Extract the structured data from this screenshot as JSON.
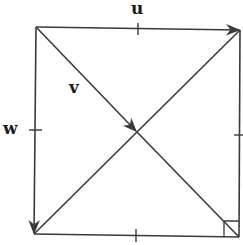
{
  "diagram": {
    "type": "vector-square",
    "labels": {
      "u": "u",
      "v": "v",
      "w": "w"
    },
    "colors": {
      "stroke": "#3a3a3a",
      "label": "#1a1a1a",
      "background": "#ffffff"
    },
    "vertices": {
      "top_left": [
        36,
        27
      ],
      "top_right": [
        240,
        30
      ],
      "bottom_left": [
        34,
        234
      ],
      "bottom_right": [
        239,
        237
      ],
      "center": [
        137,
        132
      ]
    },
    "vectors": [
      {
        "name": "u",
        "from": "top_left",
        "to": "top_right",
        "description": "top edge, arrow pointing right"
      },
      {
        "name": "v",
        "from": "top_left",
        "to": "center",
        "description": "half diagonal, arrow pointing to center"
      },
      {
        "name": "w",
        "from": "top_left",
        "to": "bottom_left",
        "description": "left edge, arrow pointing down"
      }
    ],
    "tick_marks": [
      "top-edge-midpoint",
      "left-edge-midpoint",
      "right-edge-midpoint",
      "bottom-edge-midpoint"
    ],
    "right_angle_marker": "bottom_right"
  }
}
